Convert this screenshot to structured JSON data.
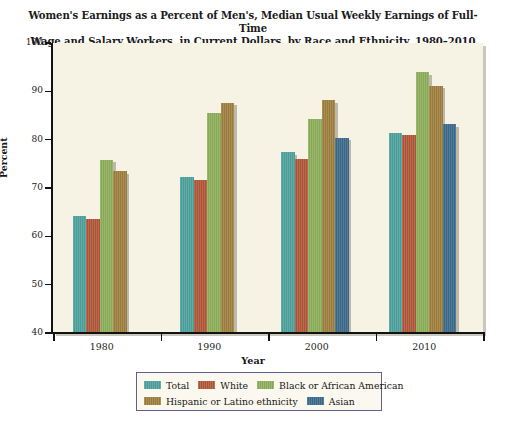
{
  "chart_data": {
    "type": "bar",
    "title": "Women's Earnings as a Percent of Men's, Median Usual Weekly Earnings of Full-Time Wage and Salary Workers, in Current Dollars, by Race and Ethnicity, 1980–2010 Annual Averages",
    "title_line1": "Women's Earnings as a Percent of Men's, Median Usual Weekly Earnings of Full-Time",
    "title_line2": "Wage and Salary Workers, in Current Dollars, by Race and Ethnicity, 1980–2010 Annual Averages",
    "xlabel": "Year",
    "ylabel": "Percent",
    "categories": [
      "1980",
      "1990",
      "2000",
      "2010"
    ],
    "ylim": [
      40,
      100
    ],
    "yticks": [
      40,
      50,
      60,
      70,
      80,
      90,
      100
    ],
    "grid": false,
    "legend_position": "bottom",
    "series": [
      {
        "name": "Total",
        "color": "#4fa39f",
        "values": [
          64.2,
          72.2,
          77.4,
          81.4
        ]
      },
      {
        "name": "White",
        "color": "#b2593a",
        "values": [
          63.6,
          71.6,
          76.1,
          80.9
        ]
      },
      {
        "name": "Black or African American",
        "color": "#8fb05c",
        "values": [
          75.8,
          85.6,
          84.3,
          93.9
        ]
      },
      {
        "name": "Hispanic or Latino ethnicity",
        "color": "#a08140",
        "values": [
          73.5,
          87.6,
          88.2,
          91.2
        ]
      },
      {
        "name": "Asian",
        "color": "#3d6d8d",
        "values": [
          null,
          null,
          80.4,
          83.2
        ]
      }
    ]
  },
  "colors": {
    "plot_background": "#f6f3e4",
    "axis": "#121212",
    "legend_border": "#5f5f92",
    "page_background": "#ffffff"
  }
}
